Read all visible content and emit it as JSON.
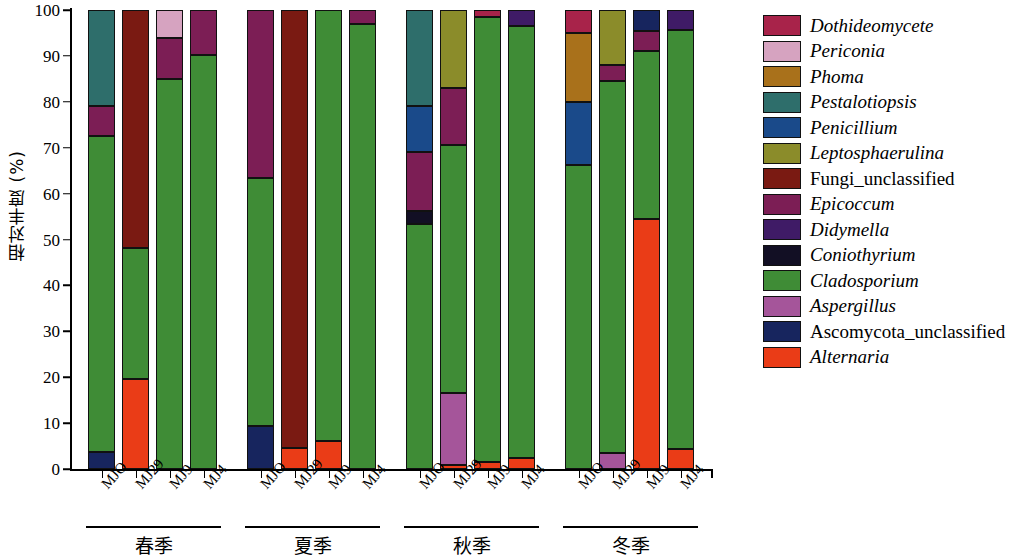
{
  "chart_data": {
    "type": "bar",
    "subtype": "stacked-bar-100-percent",
    "title": "",
    "xlabel": "",
    "ylabel": "相对丰度 (%)",
    "ylim": [
      0,
      100
    ],
    "yticks": [
      0,
      10,
      20,
      30,
      40,
      50,
      60,
      70,
      80,
      90,
      100
    ],
    "grid": false,
    "legend_position": "right",
    "stack_order_bottom_to_top": [
      "Alternaria",
      "Ascomycota_unclassified",
      "Aspergillus",
      "Cladosporium",
      "Coniothyrium",
      "Didymella",
      "Epicoccum",
      "Fungi_unclassified",
      "Leptosphaerulina",
      "Penicillium",
      "Pestalotiopsis",
      "Phoma",
      "Periconia",
      "Dothideomycete"
    ],
    "groups": [
      {
        "label": "春季",
        "categories": [
          "MJO",
          "MJ29",
          "MJ9",
          "MJ4"
        ],
        "bars": [
          {
            "category": "MJO",
            "segments": [
              {
                "taxon": "Ascomycota_unclassified",
                "value": 3.8
              },
              {
                "taxon": "Cladosporium",
                "value": 68.7
              },
              {
                "taxon": "Epicoccum",
                "value": 6.5
              },
              {
                "taxon": "Pestalotiopsis",
                "value": 21.0
              }
            ]
          },
          {
            "category": "MJ29",
            "segments": [
              {
                "taxon": "Alternaria",
                "value": 19.6
              },
              {
                "taxon": "Cladosporium",
                "value": 28.6
              },
              {
                "taxon": "Fungi_unclassified",
                "value": 51.8
              }
            ]
          },
          {
            "category": "MJ9",
            "segments": [
              {
                "taxon": "Cladosporium",
                "value": 84.9
              },
              {
                "taxon": "Epicoccum",
                "value": 9.1
              },
              {
                "taxon": "Periconia",
                "value": 6.0
              }
            ]
          },
          {
            "category": "MJ4",
            "segments": [
              {
                "taxon": "Cladosporium",
                "value": 90.2
              },
              {
                "taxon": "Epicoccum",
                "value": 9.8
              }
            ]
          }
        ]
      },
      {
        "label": "夏季",
        "categories": [
          "MJO",
          "MJ29",
          "MJ9",
          "MJ4"
        ],
        "bars": [
          {
            "category": "MJO",
            "segments": [
              {
                "taxon": "Ascomycota_unclassified",
                "value": 9.3
              },
              {
                "taxon": "Cladosporium",
                "value": 54.2
              },
              {
                "taxon": "Epicoccum",
                "value": 36.5
              }
            ]
          },
          {
            "category": "MJ29",
            "segments": [
              {
                "taxon": "Alternaria",
                "value": 4.5
              },
              {
                "taxon": "Fungi_unclassified",
                "value": 95.5
              }
            ]
          },
          {
            "category": "MJ9",
            "segments": [
              {
                "taxon": "Alternaria",
                "value": 6.0
              },
              {
                "taxon": "Cladosporium",
                "value": 94.0
              }
            ]
          },
          {
            "category": "MJ4",
            "segments": [
              {
                "taxon": "Cladosporium",
                "value": 97.0
              },
              {
                "taxon": "Epicoccum",
                "value": 3.0
              }
            ]
          }
        ]
      },
      {
        "label": "秋季",
        "categories": [
          "MJO",
          "MJ29",
          "MJ9",
          "MJ4"
        ],
        "bars": [
          {
            "category": "MJO",
            "segments": [
              {
                "taxon": "Cladosporium",
                "value": 53.3
              },
              {
                "taxon": "Coniothyrium",
                "value": 3.0
              },
              {
                "taxon": "Epicoccum",
                "value": 12.7
              },
              {
                "taxon": "Penicillium",
                "value": 10.0
              },
              {
                "taxon": "Pestalotiopsis",
                "value": 21.0
              }
            ]
          },
          {
            "category": "MJ29",
            "segments": [
              {
                "taxon": "Alternaria",
                "value": 0.8
              },
              {
                "taxon": "Aspergillus",
                "value": 15.7
              },
              {
                "taxon": "Cladosporium",
                "value": 54.1
              },
              {
                "taxon": "Epicoccum",
                "value": 12.4
              },
              {
                "taxon": "Leptosphaerulina",
                "value": 17.0
              }
            ]
          },
          {
            "category": "MJ9",
            "segments": [
              {
                "taxon": "Alternaria",
                "value": 1.5
              },
              {
                "taxon": "Cladosporium",
                "value": 97.0
              },
              {
                "taxon": "Dothideomycete",
                "value": 1.5
              }
            ]
          },
          {
            "category": "MJ4",
            "segments": [
              {
                "taxon": "Alternaria",
                "value": 2.5
              },
              {
                "taxon": "Cladosporium",
                "value": 94.0
              },
              {
                "taxon": "Didymella",
                "value": 3.5
              }
            ]
          }
        ]
      },
      {
        "label": "冬季",
        "categories": [
          "MJO",
          "MJ29",
          "MJ9",
          "MJ4"
        ],
        "bars": [
          {
            "category": "MJO",
            "segments": [
              {
                "taxon": "Cladosporium",
                "value": 66.3
              },
              {
                "taxon": "Penicillium",
                "value": 13.7
              },
              {
                "taxon": "Phoma",
                "value": 15.0
              },
              {
                "taxon": "Dothideomycete",
                "value": 5.0
              }
            ]
          },
          {
            "category": "MJ29",
            "segments": [
              {
                "taxon": "Aspergillus",
                "value": 3.5
              },
              {
                "taxon": "Cladosporium",
                "value": 81.0
              },
              {
                "taxon": "Epicoccum",
                "value": 3.5
              },
              {
                "taxon": "Leptosphaerulina",
                "value": 12.0
              }
            ]
          },
          {
            "category": "MJ9",
            "segments": [
              {
                "taxon": "Alternaria",
                "value": 54.5
              },
              {
                "taxon": "Cladosporium",
                "value": 36.5
              },
              {
                "taxon": "Epicoccum",
                "value": 4.5
              },
              {
                "taxon": "Ascomycota_unclassified",
                "value": 4.5
              }
            ]
          },
          {
            "category": "MJ4",
            "segments": [
              {
                "taxon": "Alternaria",
                "value": 4.3
              },
              {
                "taxon": "Cladosporium",
                "value": 91.4
              },
              {
                "taxon": "Didymella",
                "value": 4.3
              }
            ]
          }
        ]
      }
    ]
  },
  "legend": {
    "items": [
      {
        "label": "Dothideomycete",
        "color": "#a8234a",
        "italic": true
      },
      {
        "label": "Periconia",
        "color": "#d6a3c0",
        "italic": true
      },
      {
        "label": "Phoma",
        "color": "#a9711b",
        "italic": true
      },
      {
        "label": "Pestalotiopsis",
        "color": "#2e6e6b",
        "italic": true
      },
      {
        "label": "Penicillium",
        "color": "#1a4a8a",
        "italic": true
      },
      {
        "label": "Leptosphaerulina",
        "color": "#8b8c2a",
        "italic": true
      },
      {
        "label": "Fungi_unclassified",
        "color": "#7a1a12",
        "italic": false
      },
      {
        "label": "Epicoccum",
        "color": "#7c1e55",
        "italic": true
      },
      {
        "label": "Didymella",
        "color": "#3f1b66",
        "italic": true
      },
      {
        "label": "Coniothyrium",
        "color": "#120f24",
        "italic": true
      },
      {
        "label": "Cladosporium",
        "color": "#3f8c36",
        "italic": true
      },
      {
        "label": "Aspergillus",
        "color": "#a5559a",
        "italic": true
      },
      {
        "label": "Ascomycota_unclassified",
        "color": "#17255e",
        "italic": false
      },
      {
        "label": "Alternaria",
        "color": "#ea3c17",
        "italic": true
      }
    ]
  }
}
